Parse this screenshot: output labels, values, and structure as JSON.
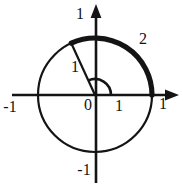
{
  "diagram": {
    "type": "unit-circle-with-arc",
    "ink_color": "#141414",
    "background_color": "#ffffff",
    "labels": {
      "y_axis_top": "1",
      "y_axis_bottom": "-1",
      "x_axis_left": "-1",
      "x_axis_right": "1",
      "x_axis_unit": "1",
      "origin": "0",
      "radius": "1",
      "arc_length": "2"
    },
    "geometry": {
      "circle_radius_units": 1,
      "arc_angle_radians": 2,
      "highlighted_arc_from_radians": 0,
      "highlighted_arc_to_radians": 2
    }
  }
}
